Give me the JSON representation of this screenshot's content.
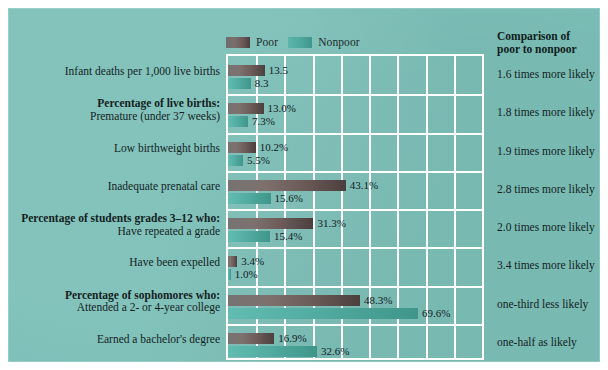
{
  "panel": {
    "background_color": "#7cc0b8",
    "border_color": "#ffffff"
  },
  "legend": {
    "items": [
      {
        "label": "Poor",
        "color": "#6b5a58",
        "key": "poor"
      },
      {
        "label": "Nonpoor",
        "color": "#4ea79c",
        "key": "nonpoor"
      }
    ]
  },
  "comparison": {
    "title_line1": "Comparison of",
    "title_line2": "poor to nonpoor",
    "values": [
      "1.6 times more likely",
      "1.8 times more likely",
      "1.9 times more likely",
      "2.8 times more likely",
      "2.0 times more likely",
      "3.4 times more likely",
      "one-third less likely",
      "one-half as likely"
    ]
  },
  "chart_data": {
    "type": "bar",
    "orientation": "horizontal",
    "title": "",
    "xlabel": "",
    "ylabel": "",
    "xlim": [
      0,
      93
    ],
    "grid": true,
    "gridline_count_vertical": 8,
    "legend_position": "top-left-of-plot",
    "categories": [
      "Infant deaths per 1,000 live births",
      "Percentage of live births: Premature (under 37 weeks)",
      "Low birthweight births",
      "Inadequate prenatal care",
      "Percentage of students grades 3–12 who: Have repeated a grade",
      "Have been expelled",
      "Percentage of sophomores who: Attended a 2- or 4-year college",
      "Earned a bachelor's degree"
    ],
    "series": [
      {
        "name": "Poor",
        "color": "#6b5a58",
        "values": [
          13.5,
          13.0,
          10.2,
          43.1,
          31.3,
          3.4,
          48.3,
          16.9
        ],
        "labels": [
          "13.5",
          "13.0%",
          "10.2%",
          "43.1%",
          "31.3%",
          "3.4%",
          "48.3%",
          "16.9%"
        ]
      },
      {
        "name": "Nonpoor",
        "color": "#4ea79c",
        "values": [
          8.3,
          7.3,
          5.5,
          15.6,
          15.4,
          1.0,
          69.6,
          32.6
        ],
        "labels": [
          "8.3",
          "7.3%",
          "5.5%",
          "15.6%",
          "15.4%",
          "1.0%",
          "69.6%",
          "32.6%"
        ]
      }
    ],
    "row_labels": [
      {
        "header": "",
        "sub": "Infant deaths per 1,000 live births"
      },
      {
        "header": "Percentage of live births:",
        "sub": "Premature (under 37 weeks)"
      },
      {
        "header": "",
        "sub": "Low birthweight births"
      },
      {
        "header": "",
        "sub": "Inadequate prenatal care"
      },
      {
        "header": "Percentage of students grades 3–12 who:",
        "sub": "Have repeated a grade"
      },
      {
        "header": "",
        "sub": "Have been expelled"
      },
      {
        "header": "Percentage of sophomores who:",
        "sub": "Attended a 2- or 4-year college"
      },
      {
        "header": "",
        "sub": "Earned a bachelor's degree"
      }
    ]
  }
}
